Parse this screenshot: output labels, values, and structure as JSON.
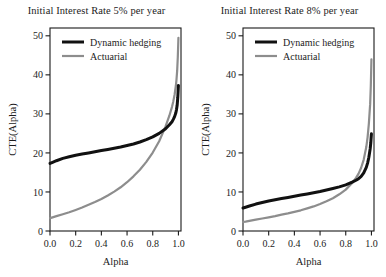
{
  "figure": {
    "background": "#ffffff",
    "panel_count": 2
  },
  "chart_data": [
    {
      "type": "line",
      "title": "Initial Interest Rate 5% per year",
      "xlabel": "Alpha",
      "ylabel": "CTE(Alpha)",
      "xlim": [
        0.0,
        1.02
      ],
      "ylim": [
        0,
        52
      ],
      "xticks": [
        "0.0",
        "0.2",
        "0.4",
        "0.6",
        "0.8",
        "1.0"
      ],
      "xtick_values": [
        0.0,
        0.2,
        0.4,
        0.6,
        0.8,
        1.0
      ],
      "yticks": [
        "0",
        "10",
        "20",
        "30",
        "40",
        "50"
      ],
      "ytick_values": [
        0,
        10,
        20,
        30,
        40,
        50
      ],
      "grid": false,
      "legend_position": "top-left",
      "series": [
        {
          "name": "Dynamic hedging",
          "color": "#111111",
          "width": 3.0,
          "x": [
            0.0,
            0.02,
            0.05,
            0.1,
            0.15,
            0.2,
            0.25,
            0.3,
            0.35,
            0.4,
            0.45,
            0.5,
            0.55,
            0.6,
            0.65,
            0.7,
            0.75,
            0.8,
            0.85,
            0.9,
            0.93,
            0.95,
            0.96,
            0.97,
            0.98,
            0.985,
            0.99,
            0.995,
            1.0
          ],
          "y": [
            17.3,
            17.6,
            18.0,
            18.6,
            19.0,
            19.4,
            19.7,
            20.0,
            20.3,
            20.6,
            20.9,
            21.2,
            21.5,
            21.9,
            22.3,
            22.8,
            23.4,
            24.1,
            25.0,
            26.2,
            27.2,
            28.0,
            28.6,
            29.3,
            30.3,
            31.1,
            32.2,
            34.2,
            37.3
          ]
        },
        {
          "name": "Actuarial",
          "color": "#8d8d8d",
          "width": 2.2,
          "x": [
            0.0,
            0.02,
            0.05,
            0.1,
            0.15,
            0.2,
            0.25,
            0.3,
            0.35,
            0.4,
            0.45,
            0.5,
            0.55,
            0.6,
            0.65,
            0.7,
            0.75,
            0.8,
            0.85,
            0.9,
            0.93,
            0.95,
            0.96,
            0.97,
            0.98,
            0.985,
            0.99,
            0.995,
            1.0
          ],
          "y": [
            3.3,
            3.5,
            3.8,
            4.3,
            4.8,
            5.4,
            6.0,
            6.7,
            7.4,
            8.2,
            9.1,
            10.1,
            11.2,
            12.5,
            14.0,
            15.7,
            17.7,
            20.1,
            23.0,
            26.8,
            29.6,
            31.8,
            33.2,
            34.9,
            37.2,
            38.8,
            41.0,
            44.5,
            49.5
          ]
        }
      ]
    },
    {
      "type": "line",
      "title": "Initial Interest Rate 8% per year",
      "xlabel": "Alpha",
      "ylabel": "CTE(Alpha)",
      "xlim": [
        0.0,
        1.02
      ],
      "ylim": [
        0,
        52
      ],
      "xticks": [
        "0.0",
        "0.2",
        "0.4",
        "0.6",
        "0.8",
        "1.0"
      ],
      "xtick_values": [
        0.0,
        0.2,
        0.4,
        0.6,
        0.8,
        1.0
      ],
      "yticks": [
        "0",
        "10",
        "20",
        "30",
        "40",
        "50"
      ],
      "ytick_values": [
        0,
        10,
        20,
        30,
        40,
        50
      ],
      "grid": false,
      "legend_position": "top-left",
      "series": [
        {
          "name": "Dynamic hedging",
          "color": "#111111",
          "width": 3.0,
          "x": [
            0.0,
            0.02,
            0.05,
            0.1,
            0.15,
            0.2,
            0.25,
            0.3,
            0.35,
            0.4,
            0.45,
            0.5,
            0.55,
            0.6,
            0.65,
            0.7,
            0.75,
            0.8,
            0.85,
            0.88,
            0.9,
            0.92,
            0.94,
            0.96,
            0.97,
            0.98,
            0.99,
            0.995,
            1.0
          ],
          "y": [
            5.9,
            6.1,
            6.4,
            6.9,
            7.3,
            7.7,
            8.0,
            8.3,
            8.6,
            8.9,
            9.2,
            9.5,
            9.8,
            10.1,
            10.5,
            10.9,
            11.3,
            11.8,
            12.5,
            13.0,
            13.4,
            14.0,
            14.9,
            16.3,
            17.4,
            18.9,
            21.0,
            22.6,
            24.9
          ]
        },
        {
          "name": "Actuarial",
          "color": "#8d8d8d",
          "width": 2.2,
          "x": [
            0.0,
            0.02,
            0.05,
            0.1,
            0.15,
            0.2,
            0.25,
            0.3,
            0.35,
            0.4,
            0.45,
            0.5,
            0.55,
            0.6,
            0.65,
            0.7,
            0.75,
            0.8,
            0.85,
            0.88,
            0.9,
            0.92,
            0.94,
            0.96,
            0.97,
            0.98,
            0.99,
            0.995,
            1.0
          ],
          "y": [
            2.3,
            2.4,
            2.6,
            2.9,
            3.2,
            3.5,
            3.8,
            4.2,
            4.5,
            4.9,
            5.3,
            5.8,
            6.3,
            6.9,
            7.6,
            8.4,
            9.4,
            10.6,
            12.3,
            13.6,
            14.7,
            16.2,
            18.3,
            21.5,
            24.0,
            27.5,
            32.5,
            37.0,
            44.0
          ]
        }
      ]
    }
  ],
  "panels": [
    {
      "id": "panel-left",
      "title": "Initial Interest Rate 5% per year",
      "xlabel": "Alpha",
      "ylabel": "CTE(Alpha)",
      "xticks": [
        "0.0",
        "0.2",
        "0.4",
        "0.6",
        "0.8",
        "1.0"
      ],
      "yticks": [
        "0",
        "10",
        "20",
        "30",
        "40",
        "50"
      ],
      "legend": [
        {
          "label": "Dynamic hedging",
          "color": "#111111",
          "width": 3.0
        },
        {
          "label": "Actuarial",
          "color": "#8d8d8d",
          "width": 2.2
        }
      ]
    },
    {
      "id": "panel-right",
      "title": "Initial Interest Rate 8% per year",
      "xlabel": "Alpha",
      "ylabel": "CTE(Alpha)",
      "xticks": [
        "0.0",
        "0.2",
        "0.4",
        "0.6",
        "0.8",
        "1.0"
      ],
      "yticks": [
        "0",
        "10",
        "20",
        "30",
        "40",
        "50"
      ],
      "legend": [
        {
          "label": "Dynamic hedging",
          "color": "#111111",
          "width": 3.0
        },
        {
          "label": "Actuarial",
          "color": "#8d8d8d",
          "width": 2.2
        }
      ]
    }
  ]
}
